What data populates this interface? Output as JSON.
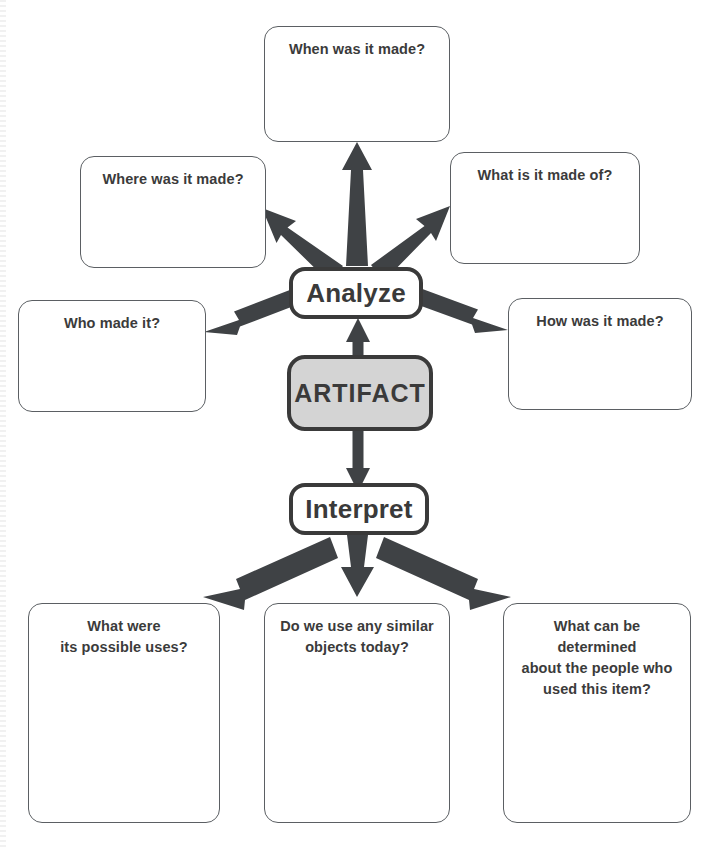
{
  "colors": {
    "box_border": "#5b5f63",
    "hub_border": "#3a3a3a",
    "artifact_fill": "#d4d4d4",
    "arrow": "#3f4245",
    "text": "#3b3b3b",
    "background": "#ffffff"
  },
  "hubs": {
    "artifact": "ARTIFACT",
    "analyze": "Analyze",
    "interpret": "Interpret"
  },
  "analyze_questions": [
    {
      "id": "when",
      "text": "When was it made?"
    },
    {
      "id": "where",
      "text": "Where was it made?"
    },
    {
      "id": "what_made_of",
      "text": "What is it made of?"
    },
    {
      "id": "who",
      "text": "Who made it?"
    },
    {
      "id": "how",
      "text": "How was it made?"
    }
  ],
  "interpret_questions": [
    {
      "id": "uses",
      "lines": [
        "What were",
        "its possible uses?"
      ]
    },
    {
      "id": "similar_objects",
      "lines": [
        "Do we use any similar",
        "objects today?"
      ]
    },
    {
      "id": "people",
      "lines": [
        "What can be determined",
        "about the people who",
        "used this item?"
      ]
    }
  ],
  "flow": {
    "artifact_to_analyze": "ARTIFACT → Analyze",
    "artifact_to_interpret": "ARTIFACT → Interpret",
    "analyze_branches": 5,
    "interpret_branches": 3
  }
}
